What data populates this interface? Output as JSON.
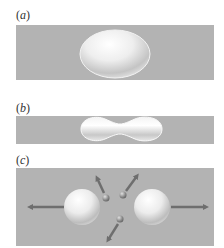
{
  "figure": {
    "panels": [
      {
        "id": "a",
        "label_open": "(",
        "label_letter": "a",
        "label_close": ")",
        "depiction": "deformed ellipsoidal nucleus"
      },
      {
        "id": "b",
        "label_open": "(",
        "label_letter": "b",
        "label_close": ")",
        "depiction": "elongated dumbbell-shaped nucleus with neck"
      },
      {
        "id": "c",
        "label_open": "(",
        "label_letter": "c",
        "label_close": ")",
        "depiction": "two fission fragments moving apart with three emitted neutrons"
      }
    ]
  },
  "colors": {
    "background": "#ffffff",
    "panel_fill": "#b3b3b3",
    "nucleus_highlight": "#ffffff",
    "nucleus_shadow": "#a8a8a8",
    "arrow": "#6e6e6e",
    "neutron": "#8a8a8a"
  }
}
